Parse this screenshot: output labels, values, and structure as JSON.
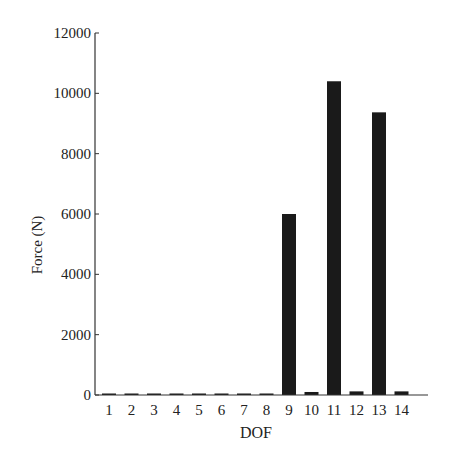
{
  "chart_data": {
    "type": "bar",
    "title": "",
    "xlabel": "DOF",
    "ylabel": "Force (N)",
    "categories": [
      "1",
      "2",
      "3",
      "4",
      "5",
      "6",
      "7",
      "8",
      "9",
      "10",
      "11",
      "12",
      "13",
      "14"
    ],
    "values": [
      20,
      40,
      40,
      40,
      40,
      40,
      40,
      40,
      6000,
      100,
      10400,
      120,
      9370,
      120
    ],
    "ylim": [
      0,
      12000
    ],
    "yticks": [
      "0",
      "2000",
      "4000",
      "6000",
      "8000",
      "10000",
      "12000"
    ],
    "grid": false,
    "bar_color": "#1a1a1a"
  }
}
